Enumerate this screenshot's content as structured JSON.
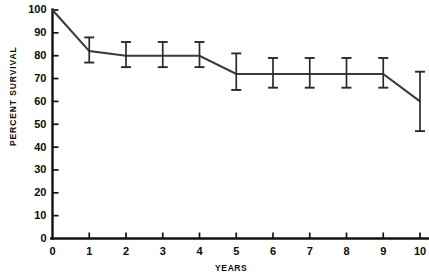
{
  "chart_data": {
    "type": "line",
    "title": "",
    "xlabel": "YEARS",
    "ylabel": "PERCENT SURVIVAL",
    "xlim": [
      0,
      10
    ],
    "ylim": [
      0,
      100
    ],
    "grid": false,
    "legend": "none",
    "x": [
      0,
      1,
      2,
      3,
      4,
      5,
      6,
      7,
      8,
      9,
      10
    ],
    "xticks": [
      "0",
      "1",
      "2",
      "3",
      "4",
      "5",
      "6",
      "7",
      "8",
      "9",
      "10"
    ],
    "yticks": [
      "0",
      "10",
      "20",
      "30",
      "40",
      "50",
      "60",
      "70",
      "80",
      "90",
      "100"
    ],
    "series": [
      {
        "name": "Percent Survival",
        "values": [
          100,
          82,
          80,
          80,
          80,
          72,
          72,
          72,
          72,
          72,
          60
        ],
        "error_low": [
          100,
          77,
          75,
          75,
          75,
          65,
          66,
          66,
          66,
          66,
          47
        ],
        "error_high": [
          100,
          88,
          86,
          86,
          86,
          81,
          79,
          79,
          79,
          79,
          73
        ]
      }
    ],
    "has_error_bars": true,
    "error_bar_years": [
      1,
      2,
      3,
      4,
      5,
      6,
      7,
      8,
      9,
      10
    ],
    "colors": {
      "line": "#3a3a3a",
      "axis": "#111111",
      "error_bar": "#2b2b2b",
      "background": "#ffffff",
      "text": "#0c0c0c"
    }
  },
  "axes": {
    "y_title": "PERCENT SURVIVAL",
    "x_title": "YEARS",
    "y_tick_labels": [
      "100",
      "90",
      "80",
      "70",
      "60",
      "50",
      "40",
      "30",
      "20",
      "10",
      "0"
    ],
    "x_tick_labels": [
      "0",
      "1",
      "2",
      "3",
      "4",
      "5",
      "6",
      "7",
      "8",
      "9",
      "10"
    ]
  }
}
